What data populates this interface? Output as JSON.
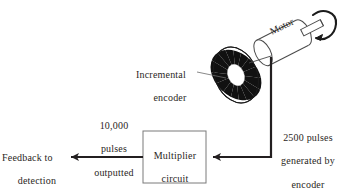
{
  "figure": {
    "type": "block-diagram",
    "background_color": "#ffffff",
    "line_color": "#231f20",
    "text_color": "#2a2623"
  },
  "labels": {
    "motor": "Motor",
    "incremental_encoder_line1": "Incremental",
    "incremental_encoder_line2": "encoder",
    "pulses_generated": "2500 pulses\ngenerated by\nencoder",
    "pulses_generated_line1": "2500 pulses",
    "pulses_generated_line2": "generated by",
    "pulses_generated_line3": "encoder",
    "pulses_outputted": "10,000\npulses\noutputted",
    "pulses_outputted_line1": "10,000",
    "pulses_outputted_line2": "pulses",
    "pulses_outputted_line3": "outputted",
    "feedback_line1": "Feedback to",
    "feedback_line2": "detection",
    "feedback_line3": "circuitry",
    "multiplier_box": "Multiplier\ncircuit\n× 4",
    "multiplier_line1": "Multiplier",
    "multiplier_line2": "circuit",
    "multiplier_line3": "× 4"
  },
  "nodes": [
    {
      "id": "motor",
      "label": "Motor",
      "shape": "cylinder",
      "rotation_deg": -27
    },
    {
      "id": "encoder",
      "label": "Incremental encoder",
      "shape": "striped-disk",
      "stripes": 16
    },
    {
      "id": "multiplier",
      "label": "Multiplier circuit × 4",
      "shape": "rectangle"
    },
    {
      "id": "detection",
      "label": "Feedback to detection circuitry",
      "shape": "text"
    }
  ],
  "edges": [
    {
      "from": "encoder",
      "to": "multiplier",
      "label": "2500 pulses generated by encoder",
      "arrow": true
    },
    {
      "from": "multiplier",
      "to": "detection",
      "label": "10,000 pulses outputted",
      "arrow": true
    }
  ],
  "icons": {
    "rotation_arrow": "rotation-arrow-icon",
    "leader_line": "leader-line"
  }
}
